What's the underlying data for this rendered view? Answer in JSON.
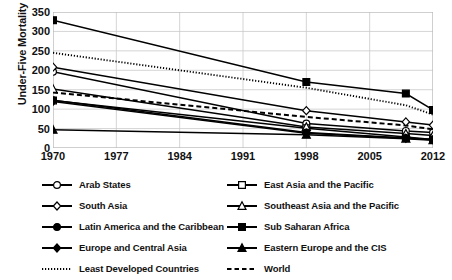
{
  "chart_data": {
    "type": "line",
    "title": "",
    "xlabel": "",
    "ylabel": "Under-Five Mortality",
    "xlim": [
      1970,
      2012
    ],
    "ylim": [
      0,
      350
    ],
    "ytick_step": 50,
    "xticks": [
      "1970",
      "1977",
      "1984",
      "1991",
      "1998",
      "2005",
      "2012"
    ],
    "yticks": [
      "350",
      "300",
      "250",
      "200",
      "150",
      "100",
      "50",
      "0"
    ],
    "grid": true,
    "legend_position": "bottom",
    "series": [
      {
        "name": "Arab States",
        "marker": "circle-open",
        "line": "solid",
        "x": [
          1970,
          1998,
          2009,
          2012
        ],
        "values": [
          196,
          63,
          44,
          40
        ]
      },
      {
        "name": "East Asia and the Pacific",
        "marker": "square-open",
        "line": "solid",
        "x": [
          1970,
          1998,
          2009,
          2012
        ],
        "values": [
          122,
          51,
          28,
          22
        ]
      },
      {
        "name": "South Asia",
        "marker": "diamond-open",
        "line": "solid",
        "x": [
          1970,
          1998,
          2009,
          2012
        ],
        "values": [
          208,
          96,
          67,
          59
        ]
      },
      {
        "name": "Southeast Asia and the Pacific",
        "marker": "triangle-open",
        "line": "solid",
        "x": [
          1970,
          1998,
          2009,
          2012
        ],
        "values": [
          152,
          54,
          37,
          32
        ]
      },
      {
        "name": "Latin America and the Caribbean",
        "marker": "circle-filled",
        "line": "solid",
        "x": [
          1970,
          1998,
          2009,
          2012
        ],
        "values": [
          123,
          40,
          26,
          22
        ]
      },
      {
        "name": "Sub Saharan Africa",
        "marker": "square-filled",
        "line": "solid",
        "x": [
          1970,
          1998,
          2009,
          2012
        ],
        "values": [
          329,
          170,
          140,
          98
        ]
      },
      {
        "name": "Europe and Central Asia",
        "marker": "diamond-filled",
        "line": "solid",
        "x": [
          1970,
          1998,
          2009,
          2012
        ],
        "values": [
          120,
          38,
          25,
          21
        ]
      },
      {
        "name": "Eastern Europe and the CIS",
        "marker": "triangle-filled",
        "line": "solid",
        "x": [
          1970,
          1998,
          2009,
          2012
        ],
        "values": [
          47,
          34,
          24,
          20
        ]
      },
      {
        "name": "Least Developed Countries",
        "marker": "none",
        "line": "dotted",
        "x": [
          1970,
          1998,
          2009,
          2012
        ],
        "values": [
          245,
          155,
          110,
          86
        ]
      },
      {
        "name": "World",
        "marker": "none",
        "line": "dashed",
        "x": [
          1970,
          1998,
          2009,
          2012
        ],
        "values": [
          143,
          80,
          58,
          48
        ]
      }
    ]
  }
}
